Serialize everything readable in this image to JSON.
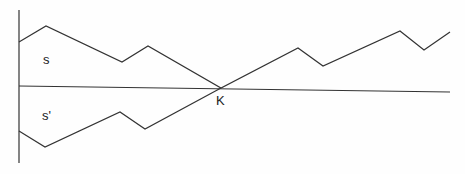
{
  "diagram": {
    "labels": {
      "upper": "s",
      "lower": "s'",
      "intersection": "K"
    },
    "stroke_color": "#333333",
    "vertical_axis": {
      "x": 19,
      "y1": 10,
      "y2": 163
    },
    "horizontal_axis": {
      "x1": 19,
      "y1": 86,
      "x2": 450,
      "y2": 92
    },
    "upper_path": "19,42 46,26 122,62 148,46 221,88 298,48 323,66 400,31 424,50 450,32",
    "lower_path": "19,131 45,147 120,112 145,129 221,88"
  }
}
